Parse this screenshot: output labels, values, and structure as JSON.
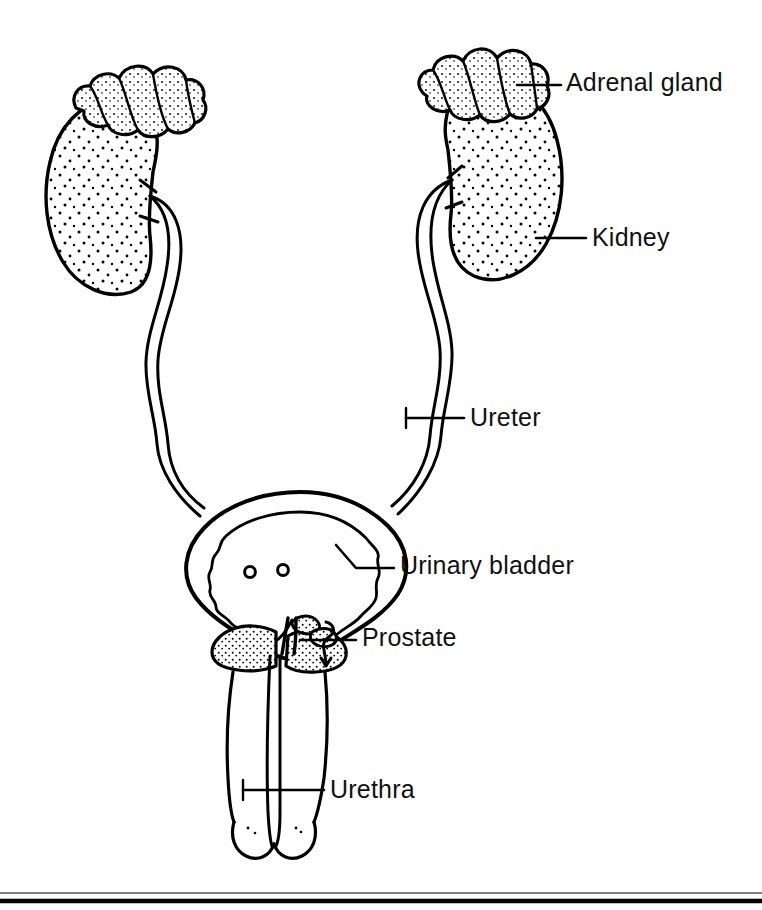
{
  "figure": {
    "background_color": "#ffffff",
    "ink_color": "#000000",
    "style": "black and white line drawing with stippled shading"
  },
  "labels": [
    {
      "id": "adrenal",
      "text": "Adrenal gland",
      "leader": "horizontal line from right adrenal gland to label"
    },
    {
      "id": "kidney",
      "text": "Kidney",
      "leader": "horizontal line from right kidney lateral border to label"
    },
    {
      "id": "ureter",
      "text": "Ureter",
      "leader": "horizontal line from right ureter to label"
    },
    {
      "id": "bladder",
      "text": "Urinary bladder",
      "leader": "diagonal then horizontal line from bladder wall to label"
    },
    {
      "id": "prostate",
      "text": "Prostate",
      "leader": "horizontal line with hook mark from prostate to label"
    },
    {
      "id": "urethra",
      "text": "Urethra",
      "leader": "horizontal line from penile urethra to label"
    }
  ],
  "structures": [
    {
      "name": "left-adrenal-gland",
      "description": "bumpy lobulated cap on superior pole of left kidney"
    },
    {
      "name": "right-adrenal-gland",
      "description": "bumpy lobulated cap on superior pole of right kidney"
    },
    {
      "name": "left-kidney",
      "description": "bean shaped organ with stippled interior, hilum facing medially right"
    },
    {
      "name": "right-kidney",
      "description": "bean shaped organ with stippled interior, hilum facing medially left"
    },
    {
      "name": "left-ureter",
      "description": "long narrow double-line tube descending from left renal hilum to bladder"
    },
    {
      "name": "right-ureter",
      "description": "long narrow double-line tube descending from right renal hilum to bladder"
    },
    {
      "name": "urinary-bladder",
      "description": "thick-walled sac with wavy inner mucosal lining"
    },
    {
      "name": "ureteral-orifices",
      "description": "two small circles on bladder trigone floor",
      "count": 2
    },
    {
      "name": "prostate-gland",
      "description": "stippled gland encircling urethra below bladder neck"
    },
    {
      "name": "seminal-vesicles",
      "description": "small shaded lobules posterior to bladder neck"
    },
    {
      "name": "penis-shaft",
      "description": "two long outlines descending from prostate to glans"
    },
    {
      "name": "penile-urethra",
      "description": "narrow central channel running the length of the penis"
    },
    {
      "name": "glans-penis",
      "description": "rounded tip at inferior end of penile shaft"
    }
  ],
  "footer_rules": [
    {
      "name": "thin-rule",
      "thickness_px": 1
    },
    {
      "name": "thick-rule",
      "thickness_px": 4
    }
  ]
}
